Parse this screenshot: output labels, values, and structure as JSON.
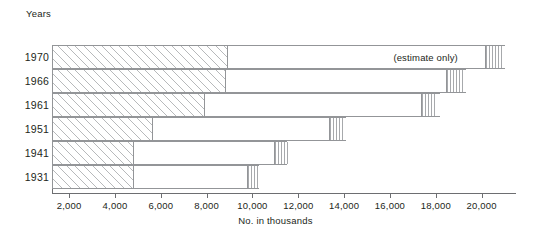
{
  "chart_data": {
    "type": "bar",
    "orientation": "horizontal",
    "title": "",
    "xlabel": "No. in thousands",
    "ylabel": "Years",
    "categories": [
      "1970",
      "1966",
      "1961",
      "1951",
      "1941",
      "1931"
    ],
    "xlim": [
      1250,
      21500
    ],
    "xticks": [
      2000,
      4000,
      6000,
      8000,
      10000,
      12000,
      14000,
      16000,
      18000,
      20000
    ],
    "xtick_labels": [
      "2,000",
      "4,000",
      "6,000",
      "8,000",
      "10,000",
      "12,000",
      "14,000",
      "16,000",
      "18,000",
      "20,000"
    ],
    "grid": false,
    "legend": "none",
    "segments": {
      "diagonal_hatch_end": [
        8900,
        8800,
        7900,
        5600,
        4800,
        4800
      ],
      "bar_total": [
        21000,
        19300,
        18200,
        14100,
        11500,
        10300
      ],
      "vertical_hatch_start": [
        20100,
        18400,
        17300,
        13300,
        10900,
        9700
      ]
    },
    "values": [
      21000,
      19300,
      18200,
      14100,
      11500,
      10300
    ],
    "annotations": [
      {
        "text": "(estimate only)",
        "row": "1970",
        "x": 18200
      }
    ]
  },
  "axes": {
    "y_title": "Years",
    "x_title": "No. in thousands"
  },
  "rows": [
    {
      "year": "1970",
      "note": "(estimate only)"
    },
    {
      "year": "1966",
      "note": ""
    },
    {
      "year": "1961",
      "note": ""
    },
    {
      "year": "1951",
      "note": ""
    },
    {
      "year": "1941",
      "note": ""
    },
    {
      "year": "1931",
      "note": ""
    }
  ],
  "xtick_labels": {
    "t0": "2,000",
    "t1": "4,000",
    "t2": "6,000",
    "t3": "8,000",
    "t4": "10,000",
    "t5": "12,000",
    "t6": "14,000",
    "t7": "16,000",
    "t8": "18,000",
    "t9": "20,000"
  },
  "colors": {
    "line": "#939598",
    "axis": "#6d6e71",
    "text": "#231f20",
    "background": "#ffffff"
  }
}
